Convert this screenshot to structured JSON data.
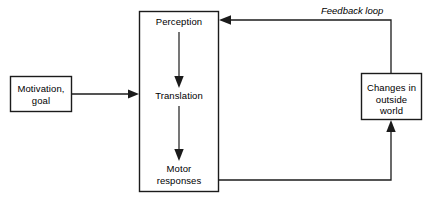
{
  "diagram": {
    "colors": {
      "stroke": "#1b1b1b",
      "fill": "#ffffff",
      "text": "#000000",
      "background": "#ffffff"
    },
    "nodes": [
      {
        "id": "motivation",
        "label": "Motivation,\ngoal",
        "shape": "rectangle",
        "x": 10,
        "y": 76,
        "width": 62,
        "height": 36
      },
      {
        "id": "process",
        "label": "",
        "shape": "rectangle",
        "x": 139,
        "y": 11,
        "width": 80,
        "height": 181
      },
      {
        "id": "perception",
        "label": "Perception",
        "shape": "text",
        "x": 139,
        "y": 16,
        "width": 80,
        "height": 12
      },
      {
        "id": "translation",
        "label": "Translation",
        "shape": "text",
        "x": 139,
        "y": 90,
        "width": 80,
        "height": 12
      },
      {
        "id": "motor-responses",
        "label": "Motor\nresponses",
        "shape": "text",
        "x": 139,
        "y": 163,
        "width": 80,
        "height": 24
      },
      {
        "id": "changes",
        "label": "Changes in\noutside\nworld",
        "shape": "rectangle",
        "x": 361,
        "y": 73,
        "width": 61,
        "height": 47
      }
    ],
    "annotations": [
      {
        "id": "feedback-loop-label",
        "text": "Feedback loop",
        "style": "italic",
        "x": 321,
        "y": 5
      }
    ],
    "edges": [
      {
        "id": "motivation-to-process",
        "from": "motivation",
        "to": "process",
        "arrow": "right",
        "label": ""
      },
      {
        "id": "perception-to-translation",
        "from": "perception",
        "to": "translation",
        "arrow": "down",
        "label": ""
      },
      {
        "id": "translation-to-motor",
        "from": "translation",
        "to": "motor-responses",
        "arrow": "down",
        "label": ""
      },
      {
        "id": "motor-to-changes",
        "from": "motor-responses",
        "to": "changes",
        "arrow": "up",
        "label": ""
      },
      {
        "id": "changes-to-perception",
        "from": "changes",
        "to": "perception",
        "arrow": "left",
        "label": "Feedback loop"
      }
    ]
  }
}
